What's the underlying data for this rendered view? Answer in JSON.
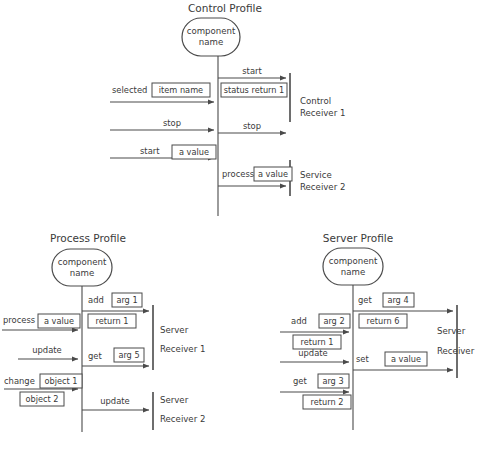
{
  "page": {
    "background": "#ffffff",
    "ink": "#3a3a3a",
    "line_color": "#4a4a4a",
    "width": 482,
    "height": 461
  },
  "profiles": [
    {
      "id": "control",
      "title": "Control Profile",
      "component": {
        "line1": "component",
        "line2": "name"
      },
      "receivers": [
        {
          "line1": "Control",
          "line2": "Receiver 1"
        },
        {
          "line1": "Service",
          "line2": "Receiver 2"
        }
      ],
      "incoming": [
        {
          "label": "selected",
          "arg": "item name"
        },
        {
          "label": "stop",
          "arg": ""
        },
        {
          "label": "start",
          "arg": "a value"
        }
      ],
      "outgoing": [
        {
          "label": "start",
          "arg": "",
          "ret": "status return 1"
        },
        {
          "label": "stop",
          "arg": "",
          "ret": ""
        },
        {
          "label": "process",
          "arg": "a value",
          "ret": ""
        }
      ]
    },
    {
      "id": "process",
      "title": "Process Profile",
      "component": {
        "line1": "component",
        "line2": "name"
      },
      "receivers": [
        {
          "line1": "Server",
          "line2": "Receiver 1"
        },
        {
          "line1": "Server",
          "line2": "Receiver 2"
        }
      ],
      "incoming": [
        {
          "label": "process",
          "arg": "a value"
        },
        {
          "label": "update",
          "arg": ""
        },
        {
          "label": "change",
          "arg": "object 1",
          "ret": "object 2"
        }
      ],
      "outgoing": [
        {
          "label": "add",
          "arg": "arg 1",
          "ret": "return 1"
        },
        {
          "label": "get",
          "arg": "arg 5",
          "ret": ""
        },
        {
          "label": "update",
          "arg": "",
          "ret": ""
        }
      ]
    },
    {
      "id": "server",
      "title": "Server Profile",
      "component": {
        "line1": "component",
        "line2": "name"
      },
      "receivers": [
        {
          "line1": "Server",
          "line2": "Receiver"
        }
      ],
      "incoming": [
        {
          "label": "add",
          "arg": "arg 2",
          "ret": "return 1"
        },
        {
          "label": "update",
          "arg": ""
        },
        {
          "label": "get",
          "arg": "arg 3",
          "ret": "return 2"
        }
      ],
      "outgoing": [
        {
          "label": "get",
          "arg": "arg 4",
          "ret": "return 6"
        },
        {
          "label": "set",
          "arg": "a value",
          "ret": ""
        }
      ]
    }
  ]
}
